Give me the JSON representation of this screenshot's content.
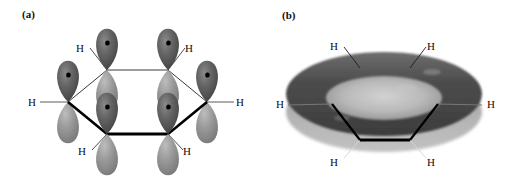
{
  "figure": {
    "type": "chemistry-orbital-diagram",
    "background_color": "#ffffff",
    "width": 513,
    "height": 180
  },
  "panels": [
    {
      "id": "a",
      "label": "(a)",
      "caption_text": "(a)",
      "description": "six p orbitals on benzene ring carbons",
      "hydrogen_labels": [
        "H",
        "H",
        "H",
        "H",
        "H",
        "H"
      ]
    },
    {
      "id": "b",
      "label": "(b)",
      "caption_text": "(b)",
      "description": "delocalized pi electron torus above and below ring",
      "hydrogen_labels": [
        "H",
        "H",
        "H",
        "H",
        "H",
        "H"
      ]
    }
  ],
  "labels": {
    "hydrogen": "H"
  },
  "panel_a": {
    "label": "(a)",
    "hydrogens": [
      {
        "name": "h-top-left",
        "text": "H",
        "x": 76,
        "y": 43
      },
      {
        "name": "h-top-right",
        "text": "H",
        "x": 185,
        "y": 43
      },
      {
        "name": "h-left",
        "text": "H",
        "x": 28,
        "y": 97
      },
      {
        "name": "h-right",
        "text": "H",
        "x": 232,
        "y": 97
      },
      {
        "name": "h-bottom-left",
        "text": "H",
        "x": 78,
        "y": 146
      },
      {
        "name": "h-bottom-right",
        "text": "H",
        "x": 183,
        "y": 146
      }
    ]
  },
  "panel_b": {
    "label": "(b)",
    "hydrogens": [
      {
        "name": "h-top-left",
        "text": "H",
        "x": 74,
        "y": 41
      },
      {
        "name": "h-top-right",
        "text": "H",
        "x": 171,
        "y": 41
      },
      {
        "name": "h-left",
        "text": "H",
        "x": 20,
        "y": 98
      },
      {
        "name": "h-right",
        "text": "H",
        "x": 229,
        "y": 98
      },
      {
        "name": "h-bottom-left",
        "text": "H",
        "x": 74,
        "y": 157
      },
      {
        "name": "h-bottom-right",
        "text": "H",
        "x": 171,
        "y": 157
      }
    ]
  },
  "colors": {
    "background": "#ffffff",
    "lobe_upper": "#5e5e5e",
    "lobe_lower": "#8d8d8d",
    "lobe_highlight": "#9a9a9a",
    "nucleus_dot": "#000000",
    "bond_thin": "#2a2a2a",
    "bond_bold": "#000000",
    "torus_outer": "#4a4a4a",
    "torus_inner": "#a8a8a8",
    "torus_shadow": "#b5b5b5",
    "text": "#0d0d0d"
  }
}
